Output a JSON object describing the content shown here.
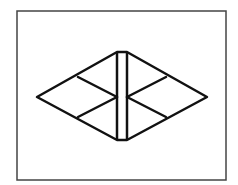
{
  "figure": {
    "stroke_color": "#111111",
    "border_color": "#444444",
    "background": "#ffffff",
    "border": {
      "x": 17,
      "y": 11,
      "width": 209,
      "height": 169
    },
    "diamond": {
      "left_tip": [
        37,
        97
      ],
      "right_tip": [
        207,
        97
      ],
      "top_left": [
        117,
        52
      ],
      "top_right": [
        127,
        52
      ],
      "bottom_left": [
        117,
        140
      ],
      "bottom_right": [
        127,
        140
      ]
    },
    "bar": {
      "x_left": 117,
      "x_right": 127,
      "y_top": 52,
      "y_bottom": 140
    },
    "inner_lines": [
      {
        "from": [
          78,
          77
        ],
        "to": [
          117,
          97
        ]
      },
      {
        "from": [
          78,
          117
        ],
        "to": [
          117,
          97
        ]
      },
      {
        "from": [
          166,
          77
        ],
        "to": [
          127,
          97
        ]
      },
      {
        "from": [
          166,
          117
        ],
        "to": [
          127,
          97
        ]
      }
    ]
  }
}
